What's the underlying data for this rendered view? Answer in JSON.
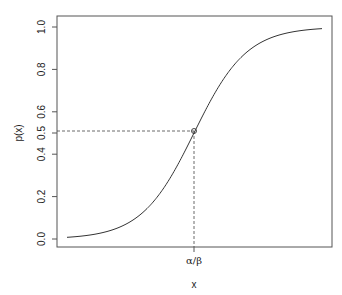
{
  "chart_data": {
    "type": "line",
    "title": "",
    "xlabel": "x",
    "ylabel": "p(x)",
    "ylim": [
      0,
      1
    ],
    "yticks": [
      "0.0",
      "0.2",
      "0.4",
      "0.5",
      "0.6",
      "0.8",
      "1.0"
    ],
    "xticks": [
      "α/β"
    ],
    "grid": false,
    "legend": null,
    "series": [
      {
        "name": "logistic curve p(x)",
        "description": "S-shaped logistic function rising from ~0 to ~1, passing 0.5 at x = α/β",
        "x_relative": [
          0.0,
          0.1,
          0.2,
          0.3,
          0.4,
          0.5,
          0.6,
          0.7,
          0.8,
          0.9,
          1.0
        ],
        "values": [
          0.003,
          0.01,
          0.03,
          0.09,
          0.25,
          0.5,
          0.75,
          0.91,
          0.97,
          0.99,
          0.997
        ]
      }
    ],
    "annotations": [
      {
        "type": "point",
        "x": "α/β",
        "y": 0.5,
        "marker": "open circle"
      },
      {
        "type": "dashed-line",
        "from": "y-axis at 0.5",
        "to": "point (α/β, 0.5)"
      },
      {
        "type": "dashed-line",
        "from": "point (α/β, 0.5)",
        "to": "x-axis at α/β"
      }
    ]
  },
  "labels": {
    "ylabel": "p(x)",
    "xlabel": "x",
    "xtick": "α/β",
    "yticks": {
      "t00": "0.0",
      "t02": "0.2",
      "t04": "0.4",
      "t05": "0.5",
      "t06": "0.6",
      "t08": "0.8",
      "t10": "1.0"
    }
  }
}
